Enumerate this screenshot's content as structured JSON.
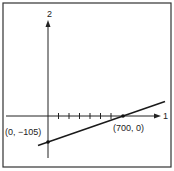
{
  "diagram": {
    "axes": {
      "vertical_label": "2",
      "horizontal_label": "1"
    },
    "points": [
      {
        "label": "(0, −105)",
        "x": 0,
        "y": -105
      },
      {
        "label": "(700, 0)",
        "x": 700,
        "y": 0
      }
    ],
    "tick_count": 7,
    "colors": {
      "line": "#1a1a1a",
      "border": "#333333",
      "background": "#ffffff"
    }
  }
}
